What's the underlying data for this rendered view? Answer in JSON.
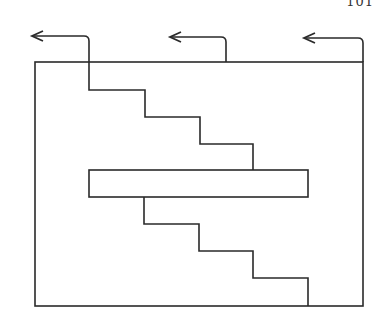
{
  "page": {
    "page_number_fragment": "101",
    "line_color": "#2a2a2a",
    "background": "#ffffff"
  },
  "diagram": {
    "outer_box": {
      "x1": 35,
      "y1": 62,
      "x2": 363,
      "y2": 306
    },
    "arrows": [
      {
        "name": "arrow-left",
        "riser_x": 89,
        "bend_y": 36,
        "tip_x": 32
      },
      {
        "name": "arrow-middle",
        "riser_x": 226,
        "bend_y": 37,
        "tip_x": 170
      },
      {
        "name": "arrow-right",
        "riser_x": 363,
        "bend_y": 38,
        "tip_x": 304
      }
    ],
    "upper_staircase": [
      [
        89,
        62
      ],
      [
        89,
        90
      ],
      [
        145,
        90
      ],
      [
        145,
        117
      ],
      [
        200,
        117
      ],
      [
        200,
        144
      ],
      [
        253,
        144
      ],
      [
        253,
        170
      ]
    ],
    "bar": {
      "x1": 89,
      "y1": 170,
      "x2": 308,
      "y2": 197
    },
    "lower_staircase": [
      [
        144,
        197
      ],
      [
        144,
        224
      ],
      [
        199,
        224
      ],
      [
        199,
        251
      ],
      [
        253,
        251
      ],
      [
        253,
        278
      ],
      [
        308,
        278
      ],
      [
        308,
        306
      ]
    ]
  }
}
